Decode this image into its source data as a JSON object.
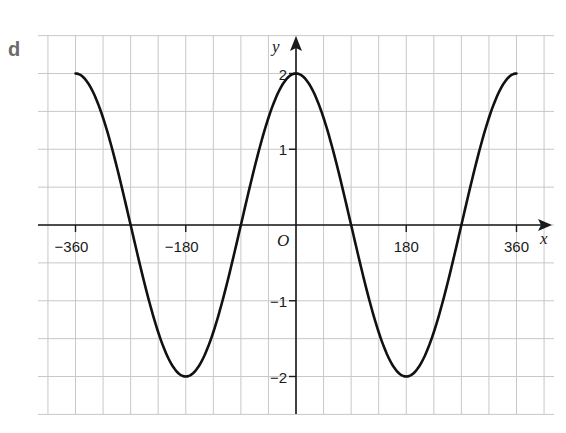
{
  "part_label": "d",
  "chart_data": {
    "type": "line",
    "title": "",
    "function": "y = 2cos(x)",
    "xlabel": "x",
    "ylabel": "y",
    "origin_label": "O",
    "xlim": [
      -400,
      400
    ],
    "ylim": [
      -2.5,
      2.5
    ],
    "grid": true,
    "x_grid_step": 45,
    "y_grid_step": 0.5,
    "x_ticks": [
      -360,
      -180,
      180,
      360
    ],
    "x_tick_labels": [
      "−360",
      "−180",
      "180",
      "360"
    ],
    "y_ticks": [
      2,
      1,
      -1,
      -2
    ],
    "y_tick_labels": [
      "2",
      "1",
      "−1",
      "−2"
    ],
    "series": [
      {
        "name": "y = 2cos x",
        "x": [
          -360,
          -315,
          -270,
          -225,
          -180,
          -135,
          -90,
          -45,
          0,
          45,
          90,
          135,
          180,
          225,
          270,
          315,
          360
        ],
        "values": [
          2,
          1.41,
          0,
          -1.41,
          -2,
          -1.41,
          0,
          1.41,
          2,
          1.41,
          0,
          -1.41,
          -2,
          -1.41,
          0,
          1.41,
          2
        ]
      }
    ],
    "colors": {
      "curve": "#111111",
      "axis": "#1a1a1a",
      "grid": "#c8c8c8",
      "label": "#6b6b6b"
    }
  }
}
